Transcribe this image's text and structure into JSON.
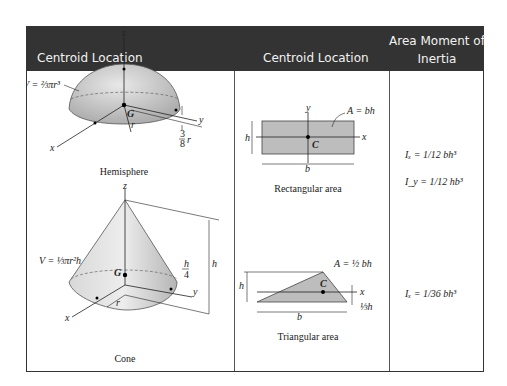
{
  "header": {
    "col1": "Centroid Location",
    "col2": "Centroid Location",
    "col3_line1": "Area Moment of",
    "col3_line2": "Inertia"
  },
  "shapes": {
    "hemisphere": {
      "caption": "Hemisphere",
      "volume_label": "V = ⅔πr³",
      "axis_x": "x",
      "axis_y": "y",
      "axis_z": "z",
      "centroid": "G",
      "radius": "r",
      "offset_label": "⅜ r",
      "offset_num": "3",
      "offset_den": "8"
    },
    "cone": {
      "caption": "Cone",
      "volume_label": "V = ⅓πr²h",
      "axis_x": "x",
      "axis_y": "y",
      "axis_z": "z",
      "centroid": "G",
      "radius": "r",
      "height": "h",
      "offset_num": "h",
      "offset_den": "4"
    },
    "rectangle": {
      "caption": "Rectangular area",
      "area_label": "A = bh",
      "axis_x": "x",
      "axis_y": "y",
      "centroid": "C",
      "base": "b",
      "height": "h",
      "ix": "Iₓ = 1/12 bh³",
      "iy": "I_y = 1/12 hb³"
    },
    "triangle": {
      "caption": "Triangular area",
      "area_label": "A = ½ bh",
      "axis_x": "x",
      "centroid": "C",
      "base": "b",
      "height": "h",
      "offset_label": "⅓h",
      "ix": "Iₓ = 1/36 bh³"
    }
  },
  "colors": {
    "header_bg": "#333333",
    "header_text": "#f2f2f2",
    "shape_fill": "#bdbdbd"
  }
}
